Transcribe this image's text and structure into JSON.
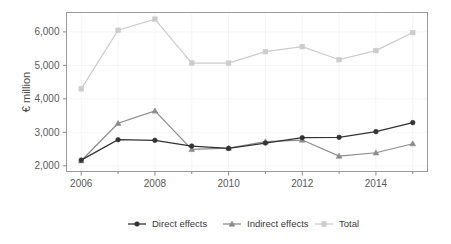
{
  "chart_data": {
    "type": "line",
    "title": "",
    "xlabel": "",
    "ylabel": "€ million",
    "x": [
      2006,
      2007,
      2008,
      2009,
      2010,
      2011,
      2012,
      2013,
      2014,
      2015
    ],
    "xtick_labels": [
      "2006",
      "2008",
      "2010",
      "2012",
      "2014"
    ],
    "xtick_values": [
      2006,
      2008,
      2010,
      2012,
      2014
    ],
    "xlim": [
      2005.6,
      2015.4
    ],
    "ytick_labels": [
      "2,000",
      "3,000",
      "4,000",
      "5,000",
      "6,000"
    ],
    "ytick_values": [
      2000,
      3000,
      4000,
      5000,
      6000
    ],
    "ylim": [
      1830,
      6580
    ],
    "grid": false,
    "legend_position": "bottom",
    "series": [
      {
        "name": "Direct effects",
        "color": "#333333",
        "marker": "circle",
        "values": [
          2170,
          2780,
          2760,
          2590,
          2520,
          2680,
          2840,
          2850,
          3020,
          3290
        ]
      },
      {
        "name": "Indirect effects",
        "color": "#8c8c8c",
        "marker": "triangle",
        "values": [
          2150,
          3270,
          3640,
          2490,
          2530,
          2720,
          2770,
          2290,
          2390,
          2660
        ]
      },
      {
        "name": "Total",
        "color": "#cccccc",
        "marker": "square",
        "values": [
          4300,
          6050,
          6380,
          5070,
          5070,
          5410,
          5560,
          5170,
          5440,
          5980
        ]
      }
    ]
  },
  "legend": {
    "items": [
      {
        "label": "Direct effects"
      },
      {
        "label": "Indirect effects"
      },
      {
        "label": "Total"
      }
    ]
  },
  "axis": {
    "y_title": "€ million"
  }
}
